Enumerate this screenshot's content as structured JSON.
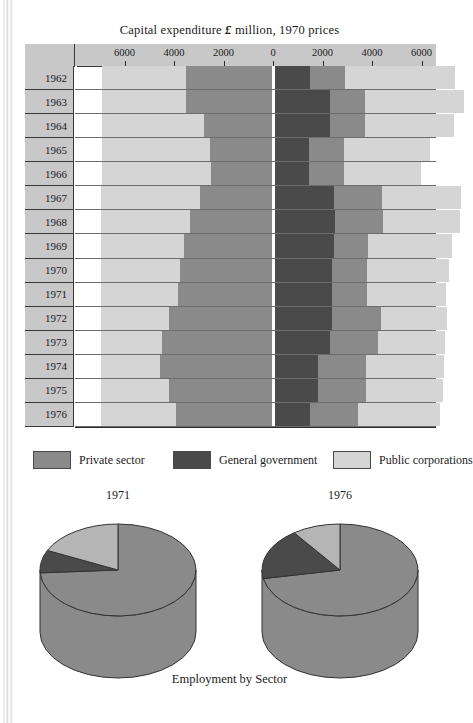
{
  "chart_data": [
    {
      "type": "bar",
      "title": "Capital expenditure £ million, 1970 prices",
      "subtitle": "",
      "orientation": "horizontal-diverging",
      "xlabel": "",
      "ylabel": "",
      "xlim": [
        -7000,
        7000
      ],
      "grid": false,
      "legend_position": "below",
      "axis_ticks_left": [
        "6000",
        "4000",
        "2000",
        "0"
      ],
      "axis_ticks_right": [
        "0",
        "2000",
        "4000",
        "6000"
      ],
      "axis_ticks": [
        "6000",
        "4000",
        "2000",
        "0",
        "2000",
        "4000",
        "6000"
      ],
      "categories": [
        "1962",
        "1963",
        "1964",
        "1965",
        "1966",
        "1967",
        "1968",
        "1969",
        "1970",
        "1971",
        "1972",
        "1973",
        "1974",
        "1975",
        "1976"
      ],
      "legend": [
        "Private sector",
        "General government",
        "Public corporations"
      ],
      "colors": {
        "private_sector": "#8a8a8a",
        "general_government": "#4a4a4a",
        "public_corporations": "#d5d5d5"
      },
      "note": "Left half and right half each stack three sectors outward from the 0 axis.",
      "left_side": {
        "order": [
          "public_corporations",
          "private_sector"
        ],
        "series": [
          {
            "name": "Public corporations",
            "values": [
              3400,
              3400,
              4100,
              4350,
              4400,
              4000,
              3600,
              3350,
              3200,
              3100,
              2750,
              2450,
              2400,
              2750,
              3050
            ]
          },
          {
            "name": "Private sector",
            "values": [
              3500,
              3500,
              2800,
              2550,
              2500,
              2950,
              3350,
              3600,
              3750,
              3850,
              4200,
              4500,
              4550,
              4200,
              3900
            ]
          }
        ]
      },
      "right_side": {
        "order": [
          "general_government",
          "private_sector",
          "public_corporations"
        ],
        "series": [
          {
            "name": "General government",
            "values": [
              1500,
              2300,
              2300,
              1450,
              1450,
              2450,
              2500,
              2450,
              2400,
              2400,
              2400,
              2300,
              1800,
              1800,
              1500
            ]
          },
          {
            "name": "Private sector",
            "values": [
              1400,
              1400,
              1400,
              1400,
              1400,
              1950,
              1950,
              1400,
              1400,
              1400,
              1950,
              1950,
              1950,
              1950,
              1950
            ]
          },
          {
            "name": "Public corporations",
            "values": [
              4450,
              4000,
              3600,
              3500,
              3150,
              3200,
              3100,
              3400,
              3300,
              3200,
              2700,
              2700,
              3150,
              3100,
              3300
            ]
          }
        ]
      }
    },
    {
      "type": "pie",
      "title": "1971",
      "labels": [
        "Private sector",
        "General government",
        "Public corporations"
      ],
      "values": [
        74,
        8,
        18
      ],
      "colors": [
        "#8a8a8a",
        "#4a4a4a",
        "#b5b5b5"
      ],
      "style": "3d-cylinder"
    },
    {
      "type": "pie",
      "title": "1976",
      "labels": [
        "Private sector",
        "General government",
        "Public corporations"
      ],
      "values": [
        72,
        18,
        10
      ],
      "colors": [
        "#8a8a8a",
        "#4a4a4a",
        "#b5b5b5"
      ],
      "style": "3d-cylinder"
    }
  ],
  "bar_chart": {
    "title_prefix": "Capital expenditure",
    "title_currency": "£",
    "title_suffix": "million, 1970 prices"
  },
  "legend": {
    "items": [
      {
        "label": "Private sector",
        "color": "#8a8a8a"
      },
      {
        "label": "General government",
        "color": "#4a4a4a"
      },
      {
        "label": "Public corporations",
        "color": "#d5d5d5"
      }
    ]
  },
  "pies": {
    "left_year": "1971",
    "right_year": "1976",
    "caption": "Employment by Sector"
  }
}
